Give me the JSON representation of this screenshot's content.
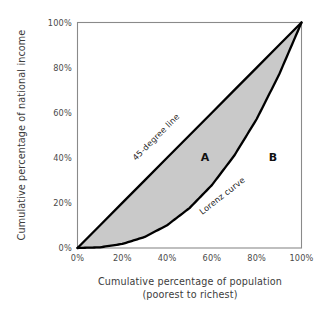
{
  "chart_data": {
    "type": "line",
    "title": "",
    "xlabel": "Cumulative percentage of population",
    "xlabel_sub": "(poorest to richest)",
    "ylabel": "Cumulative percentage of national income",
    "xlim": [
      0,
      100
    ],
    "ylim": [
      0,
      100
    ],
    "grid": false,
    "legend_position": "inline-annotations",
    "x_ticks": [
      "0%",
      "20%",
      "40%",
      "60%",
      "80%",
      "100%"
    ],
    "y_ticks": [
      "0%",
      "20%",
      "40%",
      "60%",
      "80%",
      "100%"
    ],
    "x_tick_values": [
      0,
      20,
      40,
      60,
      80,
      100
    ],
    "y_tick_values": [
      0,
      20,
      40,
      60,
      80,
      100
    ],
    "series": [
      {
        "name": "45-degree line",
        "label": "45-degree line",
        "color": "#000000",
        "x": [
          0,
          10,
          20,
          30,
          40,
          50,
          60,
          70,
          80,
          90,
          100
        ],
        "values": [
          0,
          10,
          20,
          30,
          40,
          50,
          60,
          70,
          80,
          90,
          100
        ]
      },
      {
        "name": "Lorenz curve",
        "label": "Lorenz curve",
        "color": "#000000",
        "x": [
          0,
          10,
          20,
          30,
          40,
          50,
          60,
          70,
          80,
          90,
          100
        ],
        "values": [
          0,
          0.3,
          1.8,
          4.9,
          10.1,
          17.7,
          27.9,
          41.0,
          57.2,
          76.9,
          100
        ]
      }
    ],
    "annotations": [
      {
        "text": "A",
        "note": "area between 45-degree line and Lorenz curve (shaded)",
        "x": 56,
        "y": 40
      },
      {
        "text": "B",
        "note": "area below the Lorenz curve (unshaded)",
        "x": 86,
        "y": 40
      }
    ],
    "colors": {
      "shaded_area_A": "#c9c9c9",
      "curve": "#000000",
      "frame": "#8a8a8a",
      "text": "#3c3c3c",
      "background": "#ffffff"
    }
  },
  "axes": {
    "y_title": "Cumulative percentage of national income",
    "x_title_line1": "Cumulative percentage of population",
    "x_title_line2": "(poorest to richest)",
    "x_ticks": [
      "0%",
      "20%",
      "40%",
      "60%",
      "80%",
      "100%"
    ],
    "y_ticks": [
      "0%",
      "20%",
      "40%",
      "60%",
      "80%",
      "100%"
    ]
  },
  "labels": {
    "diagonal": "45-degree line",
    "lorenz": "Lorenz curve",
    "area_a": "A",
    "area_b": "B"
  }
}
